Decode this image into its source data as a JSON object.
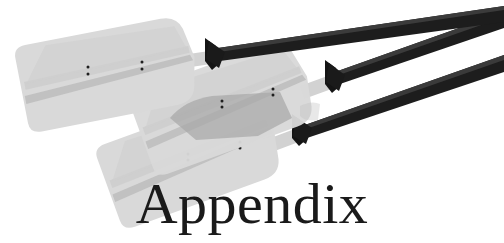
{
  "page": {
    "width": 504,
    "height": 243,
    "background_color": "#ffffff",
    "kind": "book-appendix-divider-illustration"
  },
  "title": {
    "text": "Appendix",
    "color": "#1a1a1a",
    "style": "serif"
  },
  "illustration": {
    "subject": "three-canoe-paddles",
    "description": "Three overlapping canoe paddles angled from lower-left to upper-right",
    "colors": {
      "blade_light": "#d9d9d9",
      "blade_mid": "#c8c8c8",
      "blade_spine": "#b9b9b9",
      "blade_overlap": "#a9a9a9",
      "blade_overlap_dark": "#9d9d9d",
      "shaft_dark": "#191919",
      "ferrule_dark": "#141414",
      "rivet": "#1c1c1c",
      "shaft_light": "#d4d4d4"
    },
    "paddles": [
      {
        "name": "paddle-top",
        "rivet_pairs": 2
      },
      {
        "name": "paddle-middle",
        "rivet_pairs": 2
      },
      {
        "name": "paddle-bottom",
        "rivet_pairs": 2
      }
    ]
  }
}
